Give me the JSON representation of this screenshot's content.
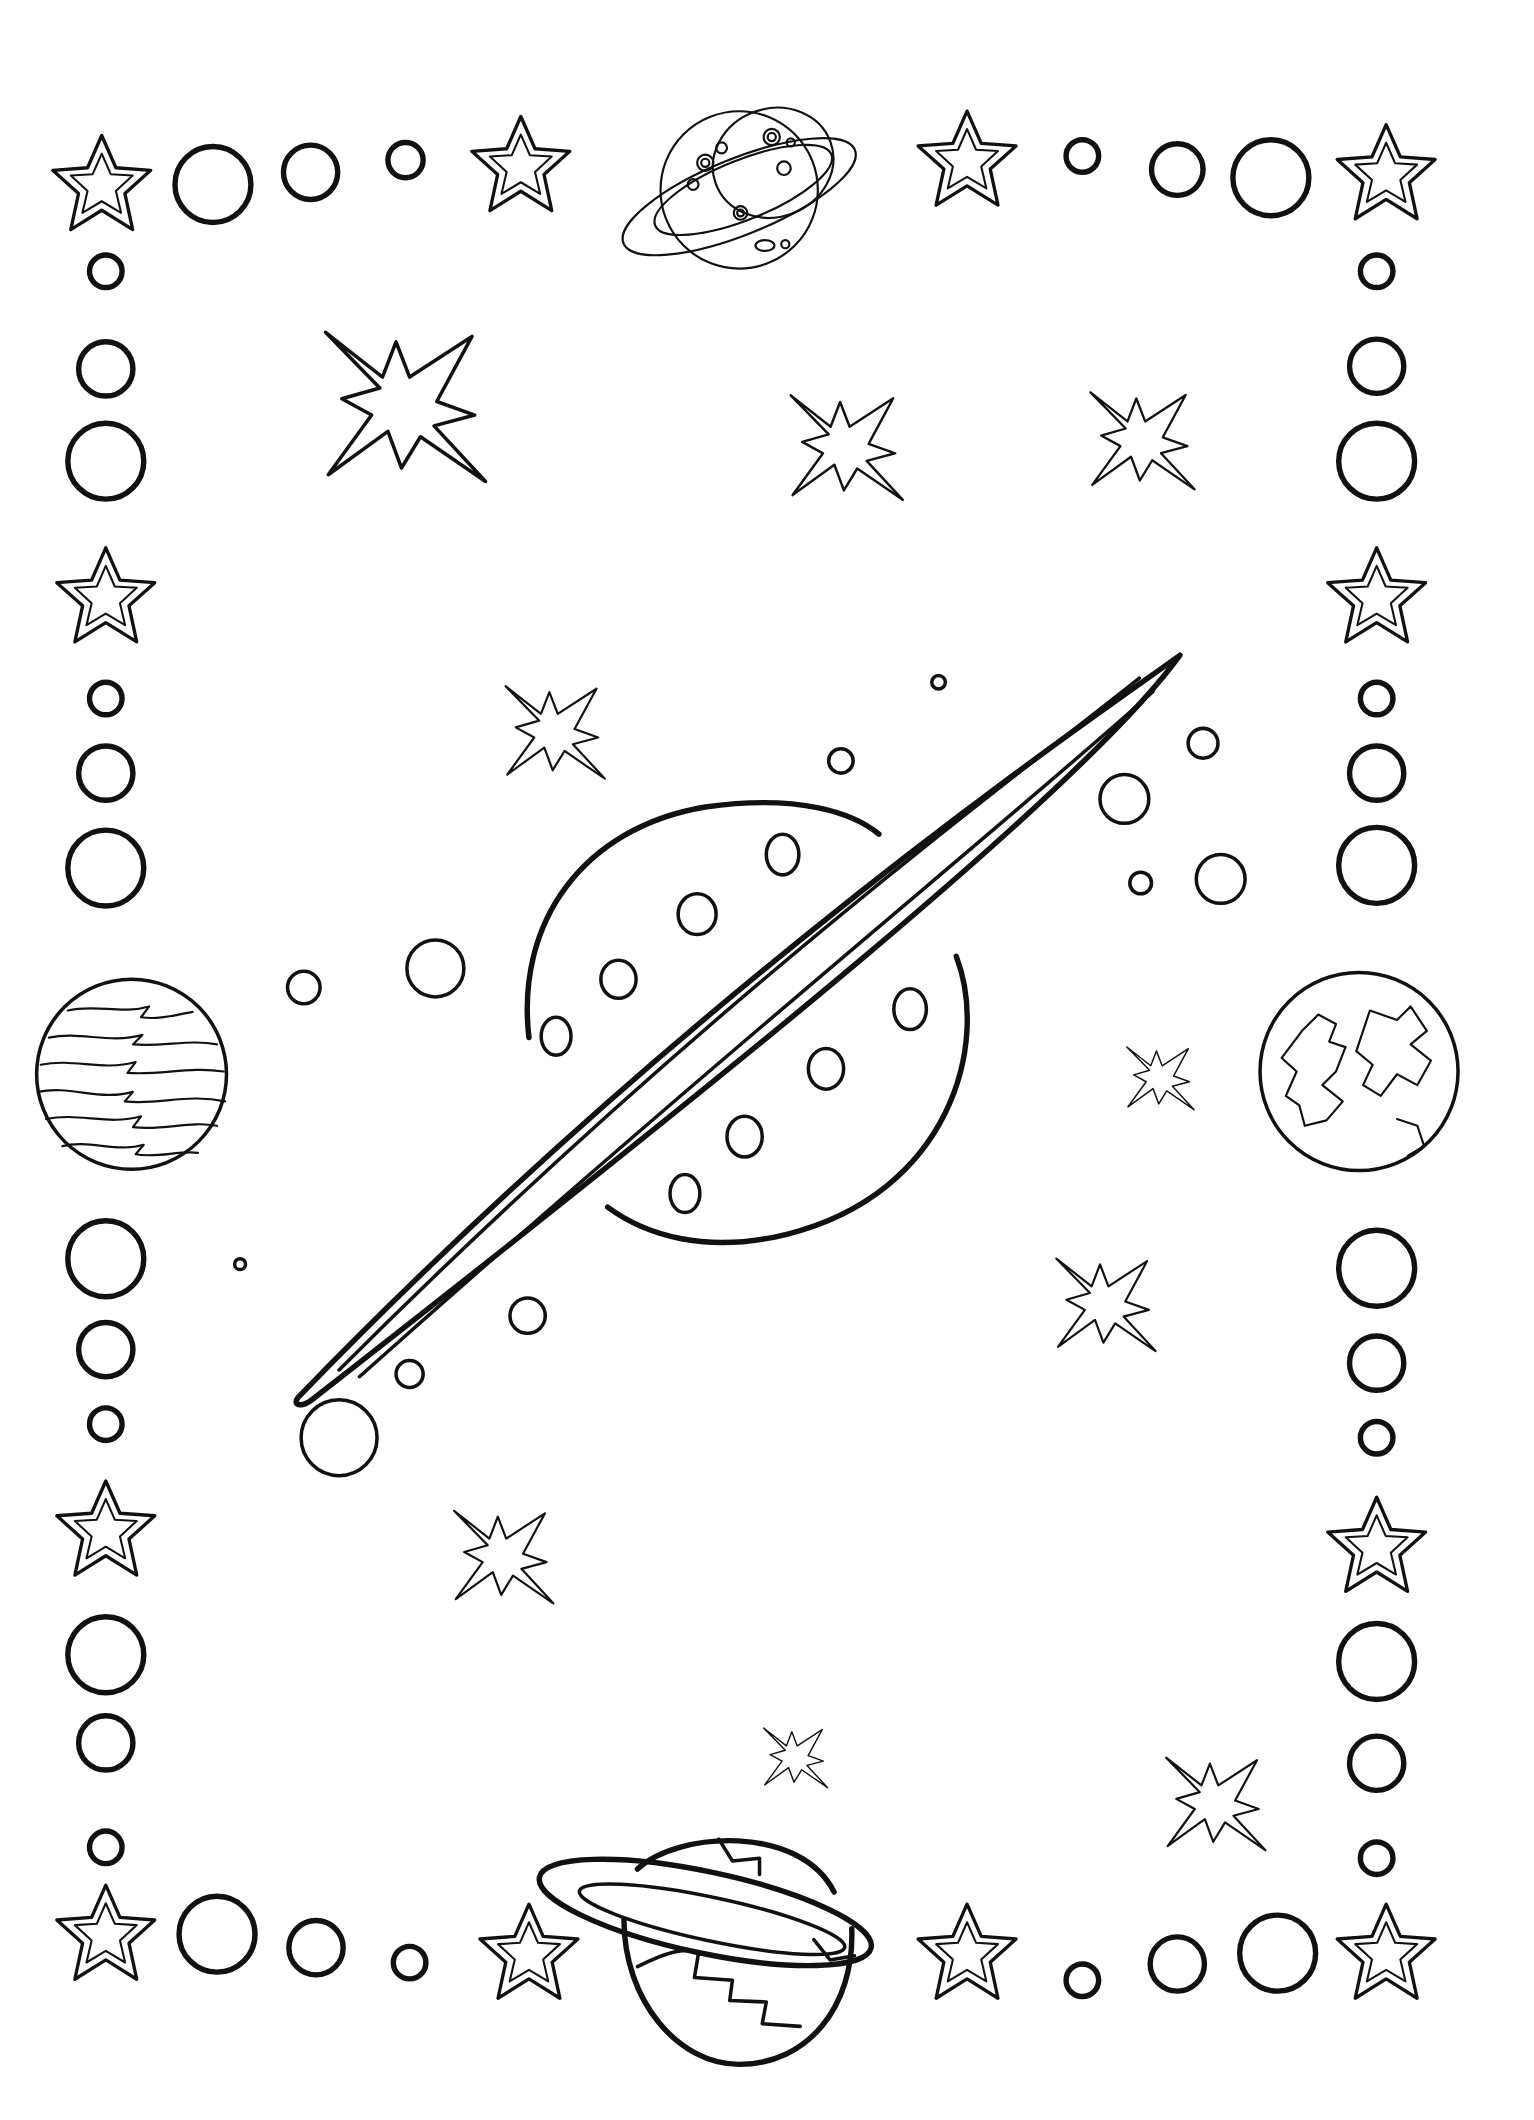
{
  "page": {
    "title": "Space coloring page",
    "background": "#ffffff",
    "line_color": "#111111"
  },
  "scene": {
    "central": {
      "name": "ringed-planet",
      "craters": 12
    },
    "corner_planets": [
      {
        "name": "cratered-ringed-planet",
        "position": "top-center"
      },
      {
        "name": "banded-planet",
        "position": "left-middle"
      },
      {
        "name": "continent-planet",
        "position": "right-middle"
      },
      {
        "name": "striped-ringed-planet",
        "position": "bottom-center"
      }
    ],
    "border": {
      "style": "stars-and-circles frame"
    },
    "sparkle_count": 10
  }
}
